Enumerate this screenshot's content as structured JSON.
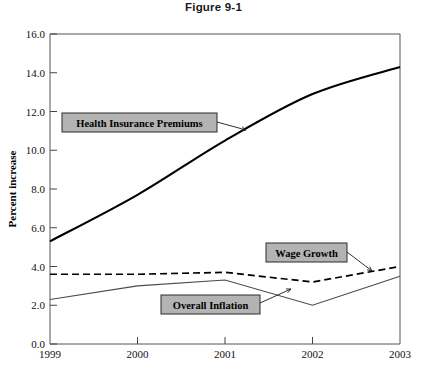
{
  "chart_data": {
    "type": "line",
    "title": "Figure 9-1",
    "xlabel": "",
    "ylabel": "Percent increase",
    "x": [
      1999,
      2000,
      2001,
      2002,
      2003
    ],
    "categories": [
      "1999",
      "2000",
      "2001",
      "2002",
      "2003"
    ],
    "xlim": [
      1999,
      2003
    ],
    "ylim": [
      0.0,
      16.0
    ],
    "ytick_labels": [
      "0.0",
      "2.0",
      "4.0",
      "6.0",
      "8.0",
      "10.0",
      "12.0",
      "14.0",
      "16.0"
    ],
    "ytick_values": [
      0.0,
      2.0,
      4.0,
      6.0,
      8.0,
      10.0,
      12.0,
      14.0,
      16.0
    ],
    "grid": false,
    "legend": "none",
    "series": [
      {
        "name": "Health Insurance Premiums",
        "style": "solid-thick",
        "values": [
          5.3,
          7.7,
          10.5,
          12.9,
          14.3
        ]
      },
      {
        "name": "Wage Growth",
        "style": "dashed",
        "values": [
          3.6,
          3.6,
          3.7,
          3.2,
          4.0
        ]
      },
      {
        "name": "Overall Inflation",
        "style": "solid-thin",
        "values": [
          2.3,
          3.0,
          3.3,
          2.0,
          3.5
        ]
      }
    ],
    "annotations": [
      {
        "label": "Health Insurance Premiums",
        "box_x": 62,
        "box_y": 113,
        "box_w": 155,
        "box_h": 19,
        "leader_x1": 217,
        "leader_y1": 122,
        "leader_x2": 246,
        "leader_y2": 130
      },
      {
        "label": "Wage Growth",
        "box_x": 266,
        "box_y": 243,
        "box_w": 81,
        "box_h": 19,
        "leader_x1": 347,
        "leader_y1": 252,
        "leader_x2": 372,
        "leader_y2": 271
      },
      {
        "label": "Overall Inflation",
        "box_x": 161,
        "box_y": 295,
        "box_w": 99,
        "box_h": 19,
        "leader_x1": 260,
        "leader_y1": 303,
        "leader_x2": 291,
        "leader_y2": 289
      }
    ]
  },
  "colors": {
    "series_primary": "#000000",
    "series_secondary": "#4a4a4a",
    "callout_fill": "#b3b3b3",
    "callout_border": "#2b2b2b",
    "axis": "#555555",
    "background": "#ffffff"
  }
}
